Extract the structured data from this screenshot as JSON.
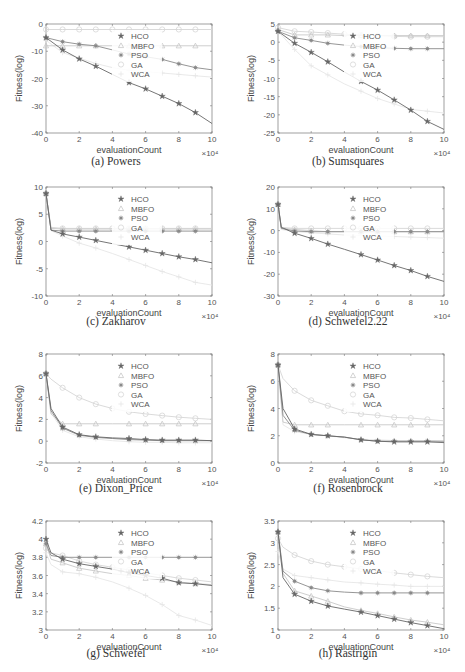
{
  "figure": {
    "legend": [
      "HCO",
      "MBFO",
      "PSO",
      "GA",
      "WCA"
    ],
    "series_styles": {
      "HCO": {
        "color": "#666666",
        "marker": "star"
      },
      "MBFO": {
        "color": "#c8c8c8",
        "marker": "triangle"
      },
      "PSO": {
        "color": "#8a8a8a",
        "marker": "asterisk"
      },
      "GA": {
        "color": "#d6d6d6",
        "marker": "circle"
      },
      "WCA": {
        "color": "#e6e6e6",
        "marker": "plus"
      }
    }
  },
  "chart_data": [
    {
      "type": "line",
      "id": "a",
      "caption": "(a) Powers",
      "xlabel": "evaluationCount",
      "ylabel": "Fitness(log)",
      "x_multiplier": "×10⁴",
      "xlim": [
        0,
        10
      ],
      "ylim": [
        -40,
        0
      ],
      "xticks": [
        0,
        2,
        4,
        6,
        8,
        10
      ],
      "yticks": [
        0,
        -10,
        -20,
        -30,
        -40
      ],
      "x": [
        0,
        1,
        2,
        3,
        4,
        5,
        6,
        7,
        8,
        9,
        10
      ],
      "series": [
        {
          "name": "HCO",
          "values": [
            -5,
            -9.5,
            -12.8,
            -15.5,
            -18.5,
            -21.5,
            -23.8,
            -26.5,
            -29.2,
            -32.5,
            -36.5
          ]
        },
        {
          "name": "MBFO",
          "values": [
            -8,
            -8,
            -8,
            -8,
            -8,
            -8,
            -8,
            -8,
            -8,
            -8,
            -8
          ]
        },
        {
          "name": "PSO",
          "values": [
            -5,
            -6.5,
            -7.4,
            -8,
            -9.5,
            -11,
            -12,
            -13,
            -14.6,
            -16,
            -16.8
          ]
        },
        {
          "name": "GA",
          "values": [
            -2,
            -2,
            -2,
            -2,
            -2,
            -2,
            -2,
            -2,
            -2,
            -2,
            -2
          ]
        },
        {
          "name": "WCA",
          "values": [
            -6,
            -10.5,
            -12.5,
            -14.5,
            -16,
            -17,
            -17.5,
            -18,
            -18.5,
            -19,
            -19.5
          ]
        }
      ]
    },
    {
      "type": "line",
      "id": "b",
      "caption": "(b) Sumsquares",
      "xlabel": "evaluationCount",
      "ylabel": "Fitness(log)",
      "x_multiplier": "×10⁴",
      "xlim": [
        0,
        10
      ],
      "ylim": [
        -25,
        5
      ],
      "xticks": [
        0,
        2,
        4,
        6,
        8,
        10
      ],
      "yticks": [
        5,
        0,
        -5,
        -10,
        -15,
        -20,
        -25
      ],
      "x": [
        0,
        1,
        2,
        3,
        4,
        5,
        6,
        7,
        8,
        9,
        10
      ],
      "series": [
        {
          "name": "HCO",
          "values": [
            3,
            -0.3,
            -2.8,
            -5.4,
            -8.2,
            -10.8,
            -13.2,
            -15.9,
            -18.7,
            -21.8,
            -24
          ]
        },
        {
          "name": "MBFO",
          "values": [
            3.5,
            2,
            2,
            2,
            1.8,
            1.8,
            1.8,
            1.8,
            1.8,
            1.8,
            1.8
          ]
        },
        {
          "name": "PSO",
          "values": [
            3,
            1.2,
            0.5,
            -0.3,
            -0.8,
            -1.2,
            -1.5,
            -1.7,
            -1.8,
            -1.8,
            -1.8
          ]
        },
        {
          "name": "GA",
          "values": [
            4,
            3,
            2.8,
            2.5,
            2.2,
            2,
            1.8,
            1.6,
            1.5,
            1.5,
            1.5
          ]
        },
        {
          "name": "WCA",
          "values": [
            3,
            -2,
            -6.5,
            -9,
            -11.5,
            -13.5,
            -15.5,
            -17,
            -18.5,
            -19,
            -19.5
          ]
        }
      ]
    },
    {
      "type": "line",
      "id": "c",
      "caption": "(c) Zakharov",
      "xlabel": "evaluationCount",
      "ylabel": "Fitness(log)",
      "x_multiplier": "×10⁴",
      "xlim": [
        0,
        10
      ],
      "ylim": [
        -10,
        10
      ],
      "xticks": [
        0,
        2,
        4,
        6,
        8,
        10
      ],
      "yticks": [
        10,
        5,
        0,
        -5,
        -10
      ],
      "x": [
        0,
        0.3,
        1,
        2,
        3,
        4,
        5,
        6,
        7,
        8,
        9,
        10
      ],
      "series": [
        {
          "name": "HCO",
          "values": [
            8.8,
            2.1,
            1.4,
            0.8,
            0.2,
            -0.4,
            -1,
            -1.6,
            -2.2,
            -2.8,
            -3.3,
            -3.9
          ]
        },
        {
          "name": "MBFO",
          "values": [
            8.8,
            2.4,
            2.3,
            2.3,
            2.3,
            2.3,
            2.3,
            2.3,
            2.3,
            2.3,
            2.3,
            2.3
          ]
        },
        {
          "name": "PSO",
          "values": [
            8.8,
            2.1,
            1.9,
            1.9,
            1.9,
            1.9,
            1.9,
            1.9,
            1.9,
            1.9,
            1.9,
            1.9
          ]
        },
        {
          "name": "GA",
          "values": [
            8.8,
            2.6,
            2.4,
            2.4,
            2.4,
            2.4,
            2.4,
            2.4,
            2.4,
            2.4,
            2.4,
            2.4
          ]
        },
        {
          "name": "WCA",
          "values": [
            8.8,
            2,
            1,
            -0.3,
            -1.2,
            -2.2,
            -3.3,
            -4.4,
            -5.5,
            -6.5,
            -7.5,
            -8
          ]
        }
      ]
    },
    {
      "type": "line",
      "id": "d",
      "caption": "(d) Schwefel2.22",
      "xlabel": "evaluationCount",
      "ylabel": "Fitness(log)",
      "x_multiplier": "×10⁴",
      "xlim": [
        0,
        10
      ],
      "ylim": [
        -30,
        20
      ],
      "xticks": [
        0,
        2,
        4,
        6,
        8,
        10
      ],
      "yticks": [
        20,
        10,
        0,
        -10,
        -20,
        -30
      ],
      "x": [
        0,
        0.2,
        1,
        2,
        3,
        4,
        5,
        6,
        7,
        8,
        9,
        10
      ],
      "series": [
        {
          "name": "HCO",
          "values": [
            12,
            1.5,
            -1.2,
            -3.6,
            -6.2,
            -8.6,
            -11,
            -13.5,
            -16,
            -18.3,
            -21,
            -23.3
          ]
        },
        {
          "name": "MBFO",
          "values": [
            12,
            1.2,
            0.5,
            0,
            -0.5,
            -0.5,
            -0.5,
            -0.5,
            -0.5,
            -0.5,
            -0.5,
            -0.5
          ]
        },
        {
          "name": "PSO",
          "values": [
            12,
            1,
            -0.2,
            -0.5,
            -0.5,
            -0.5,
            -0.5,
            -0.5,
            -0.5,
            -0.5,
            -0.5,
            -0.5
          ]
        },
        {
          "name": "GA",
          "values": [
            12,
            1.5,
            1,
            1,
            1,
            1,
            1,
            1,
            1,
            1,
            1,
            1
          ]
        },
        {
          "name": "WCA",
          "values": [
            12,
            0.5,
            -0.5,
            -1,
            -1.5,
            -2,
            -2.2,
            -2.5,
            -2.7,
            -3,
            -3.2,
            -3.5
          ]
        }
      ]
    },
    {
      "type": "line",
      "id": "e",
      "caption": "(e) Dixon_Price",
      "xlabel": "evaluationCount",
      "ylabel": "Fitness(log)",
      "x_multiplier": "×10⁴",
      "xlim": [
        0,
        10
      ],
      "ylim": [
        -2,
        8
      ],
      "xticks": [
        0,
        2,
        4,
        6,
        8,
        10
      ],
      "yticks": [
        8,
        6,
        4,
        2,
        0,
        -2
      ],
      "x": [
        0,
        0.3,
        1,
        2,
        3,
        4,
        5,
        6,
        7,
        8,
        9,
        10
      ],
      "series": [
        {
          "name": "HCO",
          "values": [
            6.2,
            3,
            1.3,
            0.6,
            0.4,
            0.3,
            0.25,
            0.15,
            0.1,
            0.1,
            0.1,
            0.05
          ]
        },
        {
          "name": "MBFO",
          "values": [
            6.2,
            2.5,
            1.6,
            1.6,
            1.6,
            1.6,
            1.6,
            1.6,
            1.6,
            1.6,
            1.6,
            1.6
          ]
        },
        {
          "name": "PSO",
          "values": [
            6.2,
            2.8,
            1.2,
            0.55,
            0.35,
            0.25,
            0.15,
            0.1,
            0.05,
            0.05,
            0.05,
            0.05
          ]
        },
        {
          "name": "GA",
          "values": [
            6.2,
            5.7,
            4.9,
            4,
            3.4,
            3,
            2.7,
            2.5,
            2.35,
            2.2,
            2.1,
            2
          ]
        },
        {
          "name": "WCA",
          "values": [
            6.2,
            2.6,
            1,
            0.4,
            0.2,
            0.05,
            -0.05,
            -0.1,
            -0.1,
            -0.15,
            -0.15,
            -0.15
          ]
        }
      ]
    },
    {
      "type": "line",
      "id": "f",
      "caption": "(f) Rosenbrock",
      "xlabel": "evaluationCount",
      "ylabel": "Fitness(log)",
      "x_multiplier": "×10⁴",
      "xlim": [
        0,
        10
      ],
      "ylim": [
        0,
        8
      ],
      "xticks": [
        0,
        2,
        4,
        6,
        8,
        10
      ],
      "yticks": [
        8,
        6,
        4,
        2,
        0
      ],
      "x": [
        0,
        0.3,
        1,
        2,
        3,
        4,
        5,
        6,
        7,
        8,
        9,
        10
      ],
      "series": [
        {
          "name": "HCO",
          "values": [
            7.2,
            4,
            2.5,
            2.1,
            2,
            1.9,
            1.7,
            1.6,
            1.55,
            1.55,
            1.55,
            1.5
          ]
        },
        {
          "name": "MBFO",
          "values": [
            7.2,
            3,
            2.8,
            2.8,
            2.8,
            2.8,
            2.8,
            2.8,
            2.8,
            2.8,
            2.8,
            2.8
          ]
        },
        {
          "name": "PSO",
          "values": [
            7.2,
            3.5,
            2.4,
            2.1,
            2,
            1.9,
            1.7,
            1.6,
            1.6,
            1.6,
            1.6,
            1.6
          ]
        },
        {
          "name": "GA",
          "values": [
            7.2,
            6.2,
            5.3,
            4.6,
            4.2,
            3.8,
            3.6,
            3.5,
            3.35,
            3.3,
            3.2,
            3.1
          ]
        },
        {
          "name": "WCA",
          "values": [
            7.2,
            2.8,
            2.3,
            2.1,
            2,
            1.85,
            1.75,
            1.7,
            1.65,
            1.65,
            1.65,
            1.6
          ]
        }
      ]
    },
    {
      "type": "line",
      "id": "g",
      "caption": "(g) Schwefel",
      "xlabel": "evaluationCount",
      "ylabel": "Fitness(log)",
      "x_multiplier": "×10⁴",
      "xlim": [
        0,
        10
      ],
      "ylim": [
        3,
        4.2
      ],
      "xticks": [
        0,
        2,
        4,
        6,
        8,
        10
      ],
      "yticks": [
        4.2,
        4,
        3.8,
        3.6,
        3.4,
        3.2,
        3
      ],
      "x": [
        0,
        0.3,
        1,
        2,
        3,
        4,
        5,
        6,
        7,
        8,
        9,
        10
      ],
      "series": [
        {
          "name": "HCO",
          "values": [
            4,
            3.85,
            3.78,
            3.73,
            3.7,
            3.67,
            3.63,
            3.6,
            3.57,
            3.52,
            3.51,
            3.49
          ]
        },
        {
          "name": "MBFO",
          "values": [
            3.95,
            3.78,
            3.74,
            3.68,
            3.65,
            3.62,
            3.6,
            3.57,
            3.55,
            3.53,
            3.51,
            3.5
          ]
        },
        {
          "name": "PSO",
          "values": [
            3.95,
            3.82,
            3.8,
            3.8,
            3.8,
            3.8,
            3.8,
            3.8,
            3.8,
            3.8,
            3.8,
            3.8
          ]
        },
        {
          "name": "GA",
          "values": [
            3.9,
            3.85,
            3.82,
            3.76,
            3.72,
            3.69,
            3.66,
            3.63,
            3.6,
            3.57,
            3.55,
            3.53
          ]
        },
        {
          "name": "WCA",
          "values": [
            3.85,
            3.72,
            3.64,
            3.62,
            3.58,
            3.53,
            3.46,
            3.38,
            3.28,
            3.16,
            3.11,
            3.05
          ]
        }
      ]
    },
    {
      "type": "line",
      "id": "h",
      "caption": "(h) Rastrigin",
      "xlabel": "evaluationCount",
      "ylabel": "Fitness(log)",
      "x_multiplier": "×10⁴",
      "xlim": [
        0,
        10
      ],
      "ylim": [
        1,
        3.5
      ],
      "xticks": [
        0,
        2,
        4,
        6,
        8,
        10
      ],
      "yticks": [
        3.5,
        3,
        2.5,
        2,
        1.5,
        1
      ],
      "x": [
        0,
        0.3,
        1,
        2,
        3,
        4,
        5,
        6,
        7,
        8,
        9,
        10
      ],
      "series": [
        {
          "name": "HCO",
          "values": [
            3.25,
            2.2,
            1.82,
            1.66,
            1.55,
            1.48,
            1.41,
            1.33,
            1.25,
            1.17,
            1.1,
            1.03
          ]
        },
        {
          "name": "MBFO",
          "values": [
            3.25,
            2.3,
            1.9,
            1.78,
            1.66,
            1.53,
            1.45,
            1.38,
            1.3,
            1.23,
            1.18,
            1.12
          ]
        },
        {
          "name": "PSO",
          "values": [
            3.25,
            2.35,
            2.12,
            1.97,
            1.9,
            1.87,
            1.85,
            1.85,
            1.85,
            1.85,
            1.85,
            1.85
          ]
        },
        {
          "name": "GA",
          "values": [
            3.1,
            2.9,
            2.72,
            2.58,
            2.5,
            2.45,
            2.4,
            2.36,
            2.31,
            2.27,
            2.23,
            2.2
          ]
        },
        {
          "name": "WCA",
          "values": [
            2.8,
            2.4,
            2.25,
            2.2,
            2.15,
            2.1,
            2.08,
            2.05,
            2.03,
            2,
            2,
            2
          ]
        }
      ]
    }
  ],
  "captions": {
    "a": "(a) Powers",
    "b": "(b) Sumsquares",
    "c": "(c) Zakharov",
    "d": "(d) Schwefel2.22",
    "e": "(e) Dixon_Price",
    "f": "(f) Rosenbrock",
    "g": "(g) Schwefel",
    "h": "(h) Rastrigin"
  }
}
